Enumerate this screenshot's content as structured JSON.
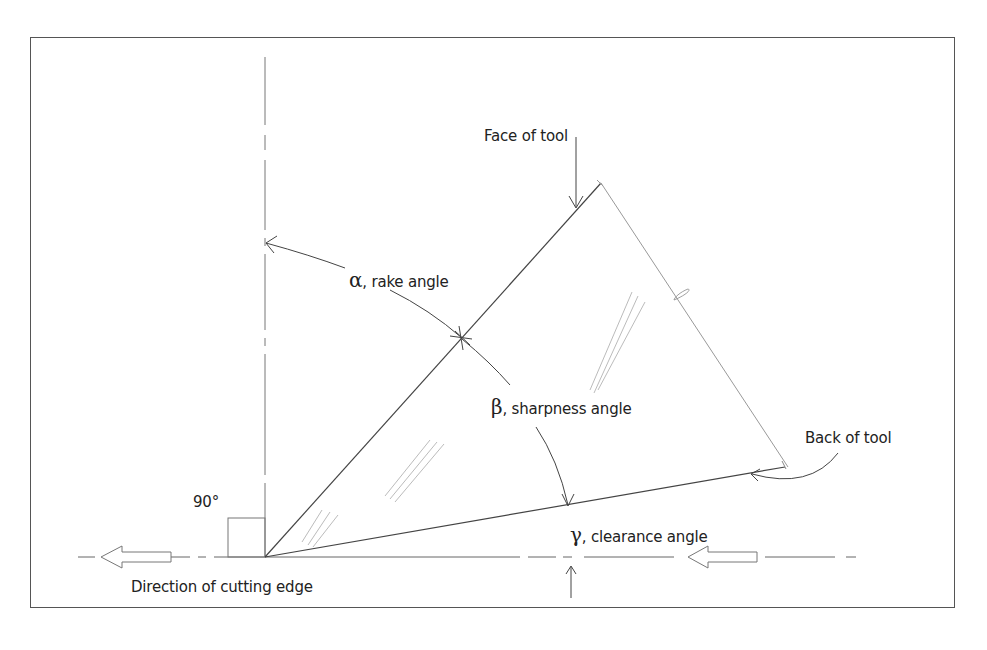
{
  "diagram": {
    "labels": {
      "face_of_tool": "Face of tool",
      "rake_angle": {
        "symbol": "α",
        "text": ", rake angle"
      },
      "sharpness_angle": {
        "symbol": "β",
        "text": ", sharpness angle"
      },
      "back_of_tool": "Back of tool",
      "right_angle": "90°",
      "clearance_angle": {
        "symbol": "γ",
        "text": ", clearance angle"
      },
      "direction": "Direction of cutting edge"
    },
    "colors": {
      "line": "#444444",
      "light_line": "#999999",
      "frame": "#555555",
      "text": "#222222"
    }
  }
}
